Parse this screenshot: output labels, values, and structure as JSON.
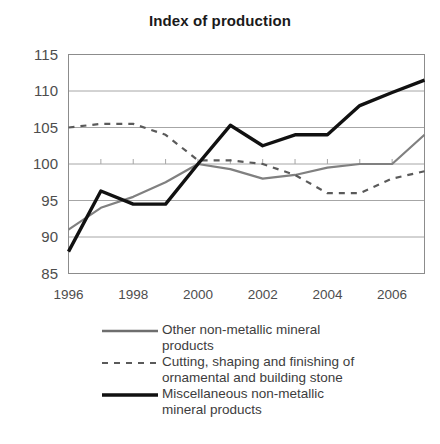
{
  "chart_data": {
    "type": "line",
    "title": "Index of production",
    "xlabel": "",
    "ylabel": "",
    "x": [
      1996,
      1997,
      1998,
      1999,
      2000,
      2001,
      2002,
      2003,
      2004,
      2005,
      2006,
      2007
    ],
    "xtick_labels": [
      "1996",
      "1998",
      "2000",
      "2002",
      "2004",
      "2006"
    ],
    "xtick_values": [
      1996,
      1998,
      2000,
      2002,
      2004,
      2006
    ],
    "ytick_labels": [
      "115",
      "110",
      "105",
      "100",
      "95",
      "90",
      "85"
    ],
    "ytick_values": [
      115,
      110,
      105,
      100,
      95,
      90,
      85
    ],
    "ylim": [
      85,
      115
    ],
    "xlim": [
      1996,
      2007
    ],
    "grid": true,
    "grid_axis": "y",
    "legend_position": "below",
    "series": [
      {
        "name": "Other non-metallic mineral products",
        "key": "other-non-metallic",
        "style": "solid-thin",
        "color": "#808080",
        "width": 2.2,
        "values": [
          91.0,
          94.0,
          95.5,
          97.5,
          100.0,
          99.3,
          98.0,
          98.5,
          99.5,
          100.0,
          100.0,
          104.0
        ]
      },
      {
        "name": "Cutting, shaping and finishing of ornamental and building stone",
        "key": "cutting-shaping-finishing",
        "style": "dashed",
        "color": "#5a5a5a",
        "width": 2.2,
        "values": [
          105.0,
          105.5,
          105.5,
          104.0,
          100.5,
          100.5,
          100.0,
          98.5,
          96.0,
          96.0,
          98.0,
          99.0
        ]
      },
      {
        "name": "Miscellaneous non-metallic mineral products",
        "key": "miscellaneous-non-metallic",
        "style": "solid-thick",
        "color": "#111111",
        "width": 3.4,
        "values": [
          88.0,
          96.3,
          94.5,
          94.5,
          100.0,
          105.3,
          102.5,
          104.0,
          104.0,
          108.0,
          109.8,
          111.5
        ]
      }
    ]
  },
  "legend": {
    "entries": [
      {
        "label_line1": "Other non-metallic mineral",
        "label_line2": "products",
        "label": "Other non-metallic mineral products"
      },
      {
        "label_line1": "Cutting, shaping and finishing of",
        "label_line2": "ornamental and building stone",
        "label": "Cutting, shaping and finishing of ornamental and building stone"
      },
      {
        "label_line1": "Miscellaneous non-metallic",
        "label_line2": "mineral products",
        "label": "Miscellaneous non-metallic mineral products"
      }
    ]
  },
  "colors": {
    "frame": "#8c8c8c",
    "grid": "#a6a6a6",
    "text": "#4d4d4d",
    "title": "#1a1a1a"
  }
}
